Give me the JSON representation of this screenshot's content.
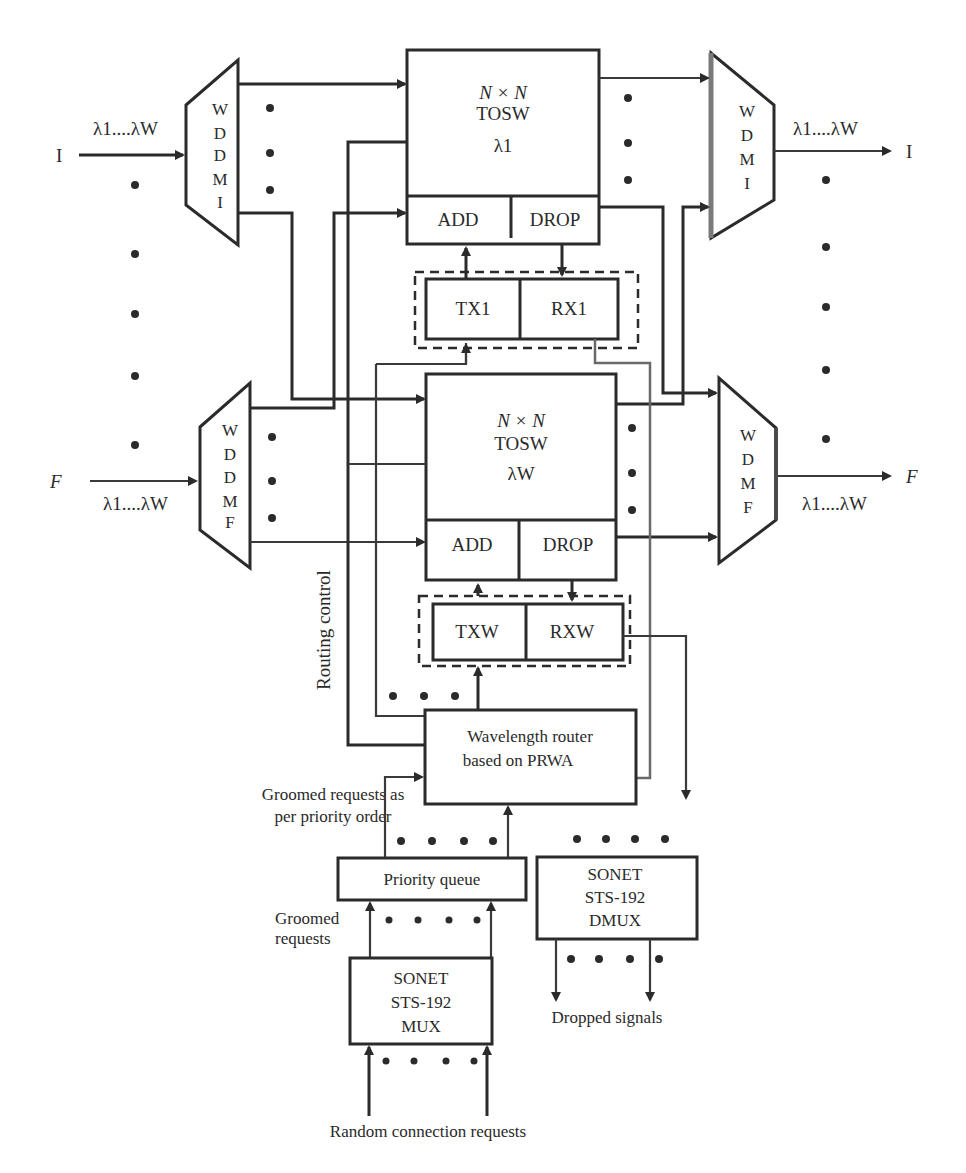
{
  "diagram": {
    "type": "block-diagram",
    "background": "#ffffff",
    "line_color": "#2b2b2b",
    "inputs": {
      "top": {
        "port": "I",
        "wavelengths": "λ1....λW"
      },
      "bottom": {
        "port": "F",
        "wavelengths": "λ1....λW"
      }
    },
    "outputs": {
      "top": {
        "port": "I",
        "wavelengths": "λ1....λW"
      },
      "bottom": {
        "port": "F",
        "wavelengths": "λ1....λW"
      }
    },
    "demux_top": {
      "letters": [
        "W",
        "D",
        "D",
        "M",
        "I"
      ]
    },
    "demux_bottom": {
      "letters": [
        "W",
        "D",
        "D",
        "M",
        "F"
      ]
    },
    "mux_top": {
      "letters": [
        "W",
        "D",
        "M",
        "I"
      ]
    },
    "mux_bottom": {
      "letters": [
        "W",
        "D",
        "M",
        "F"
      ]
    },
    "switch_top": {
      "line1": "N × N",
      "line2": "TOSW",
      "line3": "λ1",
      "add": "ADD",
      "drop": "DROP"
    },
    "switch_bottom": {
      "line1": "N × N",
      "line2": "TOSW",
      "line3": "λW",
      "add": "ADD",
      "drop": "DROP"
    },
    "transceiver_top": {
      "tx": "TX1",
      "rx": "RX1"
    },
    "transceiver_bottom": {
      "tx": "TXW",
      "rx": "RXW"
    },
    "routing_control_label": "Routing control",
    "wavelength_router": {
      "line1": "Wavelength router",
      "line2": "based on PRWA"
    },
    "groomed_priority_label": {
      "line1": "Groomed requests as",
      "line2": "per priority order"
    },
    "priority_queue": "Priority queue",
    "groomed_requests_label": {
      "line1": "Groomed",
      "line2": "requests"
    },
    "sonet_mux": {
      "line1": "SONET",
      "line2": "STS-192",
      "line3": "MUX"
    },
    "sonet_dmux": {
      "line1": "SONET",
      "line2": "STS-192",
      "line3": "DMUX"
    },
    "dropped_signals_label": "Dropped signals",
    "random_requests_label": "Random connection requests"
  }
}
